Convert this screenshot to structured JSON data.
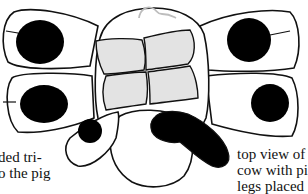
{
  "figure": {
    "colors": {
      "outline": "#111111",
      "fill_white": "#ffffff",
      "spot_black": "#000000",
      "panel_gray": "#e3e3e3",
      "hair_gray": "#bdbdbd"
    }
  },
  "captions": {
    "left": {
      "line1": "ded tri-",
      "line2": "o the pig"
    },
    "right": {
      "line1": "top view of",
      "line2": "cow with pig",
      "line3": "legs placed"
    }
  }
}
